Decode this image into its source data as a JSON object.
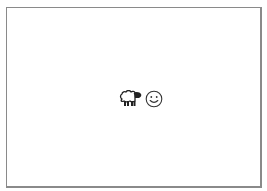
{
  "canvas": {
    "background": "#ffffff",
    "border_color": "#8a8a8a"
  },
  "icons": [
    {
      "name": "sheep-icon",
      "glyph": "🐑"
    },
    {
      "name": "smiley-icon",
      "glyph": "☺"
    }
  ]
}
